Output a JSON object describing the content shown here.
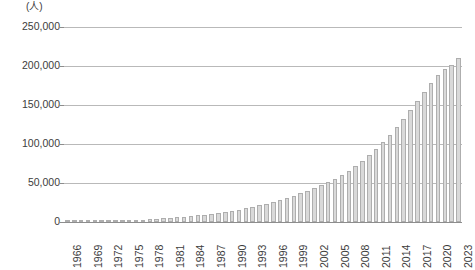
{
  "chart_data": {
    "type": "bar",
    "title": "",
    "subtitle": "",
    "unit_label": "(人)",
    "xlabel": "",
    "ylabel": "",
    "ylim": [
      0,
      250000
    ],
    "ytick_labels": [
      "250,000",
      "200,000",
      "150,000",
      "100,000",
      "50,000",
      "0"
    ],
    "ytick_values": [
      250000,
      200000,
      150000,
      100000,
      50000,
      0
    ],
    "grid": true,
    "legend": "none",
    "xtick_labels": [
      "1966",
      "1969",
      "1972",
      "1975",
      "1978",
      "1981",
      "1984",
      "1987",
      "1990",
      "1993",
      "1996",
      "1999",
      "2002",
      "2005",
      "2008",
      "2011",
      "2014",
      "2017",
      "2020",
      "2023"
    ],
    "xtick_label_rotation": 90,
    "xtick_interval_years": 3,
    "bar_color": "#d9d9d9",
    "bar_edge_color": "#aeaeae",
    "grid_color": "#b9b9b9",
    "axis_color": "#8d8d8d",
    "text_color": "#3c3c3c",
    "categories": [
      "1966",
      "1967",
      "1968",
      "1969",
      "1970",
      "1971",
      "1972",
      "1973",
      "1974",
      "1975",
      "1976",
      "1977",
      "1978",
      "1979",
      "1980",
      "1981",
      "1982",
      "1983",
      "1984",
      "1985",
      "1986",
      "1987",
      "1988",
      "1989",
      "1990",
      "1991",
      "1992",
      "1993",
      "1994",
      "1995",
      "1996",
      "1997",
      "1998",
      "1999",
      "2000",
      "2001",
      "2002",
      "2003",
      "2004",
      "2005",
      "2006",
      "2007",
      "2008",
      "2009",
      "2010",
      "2011",
      "2012",
      "2013",
      "2014",
      "2015",
      "2016",
      "2017",
      "2018",
      "2019",
      "2020",
      "2021",
      "2022",
      "2023"
    ],
    "values": [
      300,
      400,
      500,
      700,
      900,
      1100,
      1400,
      1700,
      2000,
      2400,
      2800,
      3200,
      3700,
      4200,
      4800,
      5400,
      6100,
      6800,
      7600,
      8500,
      9500,
      10500,
      11700,
      13000,
      14500,
      16000,
      17800,
      19600,
      21500,
      23600,
      25800,
      28200,
      30800,
      33600,
      36600,
      39800,
      43300,
      47000,
      51000,
      55500,
      60500,
      66000,
      72000,
      78500,
      85500,
      93500,
      102000,
      111500,
      121500,
      132000,
      143000,
      155000,
      167000,
      178000,
      188000,
      196000,
      201500,
      210000
    ]
  }
}
